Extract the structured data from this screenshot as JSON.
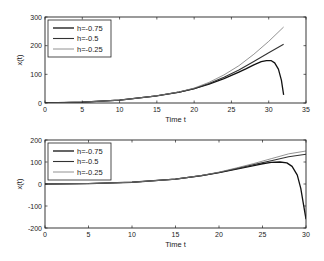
{
  "chart_data": [
    {
      "type": "line",
      "title": "",
      "xlabel": "Time t",
      "ylabel": "x(t)",
      "xlim": [
        0,
        35
      ],
      "ylim": [
        0,
        300
      ],
      "xticks": [
        0,
        5,
        10,
        15,
        20,
        25,
        30,
        35
      ],
      "yticks": [
        0,
        100,
        200,
        300
      ],
      "grid": false,
      "legend_position": "upper left",
      "series": [
        {
          "name": "h=-0.75",
          "color": "#111111",
          "width": 1.3,
          "x": [
            0,
            5,
            10,
            15,
            18,
            20,
            22,
            24,
            26,
            27,
            28,
            29,
            29.7,
            30.3,
            30.8,
            31.3,
            31.7,
            32
          ],
          "y": [
            0,
            3,
            10,
            25,
            38,
            50,
            66,
            85,
            108,
            120,
            133,
            144,
            148,
            148,
            140,
            118,
            80,
            28
          ]
        },
        {
          "name": "h=-0.5",
          "color": "#333333",
          "width": 1.1,
          "x": [
            0,
            5,
            10,
            15,
            18,
            20,
            22,
            24,
            26,
            28,
            30,
            32
          ],
          "y": [
            0,
            3,
            10,
            25,
            38,
            50,
            68,
            90,
            115,
            145,
            175,
            205
          ]
        },
        {
          "name": "h=-0.25",
          "color": "#777777",
          "width": 0.8,
          "x": [
            0,
            5,
            10,
            15,
            18,
            20,
            22,
            24,
            26,
            28,
            30,
            32
          ],
          "y": [
            0,
            3,
            10,
            25,
            39,
            52,
            72,
            98,
            130,
            170,
            215,
            265
          ]
        }
      ]
    },
    {
      "type": "line",
      "title": "",
      "xlabel": "Time t",
      "ylabel": "x(t)",
      "xlim": [
        0,
        30
      ],
      "ylim": [
        -200,
        200
      ],
      "xticks": [
        0,
        5,
        10,
        15,
        20,
        25,
        30
      ],
      "yticks": [
        -200,
        -100,
        0,
        100,
        200
      ],
      "grid": false,
      "legend_position": "upper left",
      "series": [
        {
          "name": "h=-0.75",
          "color": "#111111",
          "width": 1.3,
          "x": [
            0,
            5,
            10,
            15,
            18,
            20,
            22,
            24,
            25,
            26,
            27,
            27.8,
            28.4,
            29,
            29.4,
            29.7,
            30
          ],
          "y": [
            0,
            2,
            8,
            22,
            38,
            52,
            68,
            84,
            92,
            98,
            100,
            96,
            80,
            40,
            -20,
            -90,
            -160
          ]
        },
        {
          "name": "h=-0.5",
          "color": "#333333",
          "width": 1.1,
          "x": [
            0,
            5,
            10,
            15,
            18,
            20,
            22,
            24,
            26,
            28,
            30
          ],
          "y": [
            0,
            2,
            8,
            22,
            38,
            52,
            70,
            88,
            106,
            124,
            135
          ]
        },
        {
          "name": "h=-0.25",
          "color": "#777777",
          "width": 0.8,
          "x": [
            0,
            5,
            10,
            15,
            18,
            20,
            22,
            24,
            26,
            28,
            30
          ],
          "y": [
            0,
            2,
            8,
            22,
            39,
            54,
            73,
            93,
            115,
            137,
            150
          ]
        }
      ]
    }
  ]
}
